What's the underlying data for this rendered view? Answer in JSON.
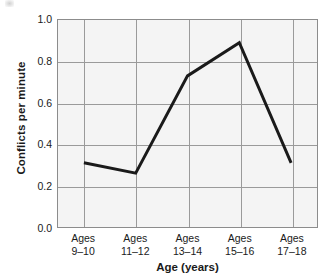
{
  "chart_data": {
    "type": "line",
    "title": "",
    "subtitle": "",
    "xlabel": "Age (years)",
    "ylabel": "Conflicts per minute",
    "categories": [
      "Ages\n9–10",
      "Ages\n11–12",
      "Ages\n13–14",
      "Ages\n15–16",
      "Ages\n17–18"
    ],
    "category_lines": [
      {
        "line1": "Ages",
        "line2": "9–10"
      },
      {
        "line1": "Ages",
        "line2": "11–12"
      },
      {
        "line1": "Ages",
        "line2": "13–14"
      },
      {
        "line1": "Ages",
        "line2": "15–16"
      },
      {
        "line1": "Ages",
        "line2": "17–18"
      }
    ],
    "values": [
      0.31,
      0.26,
      0.73,
      0.89,
      0.31
    ],
    "series": [
      {
        "name": "Conflicts per minute",
        "values": [
          0.31,
          0.26,
          0.73,
          0.89,
          0.31
        ]
      }
    ],
    "ylim": [
      0.0,
      1.0
    ],
    "ytick_values": [
      1.0,
      0.8,
      0.6,
      0.4,
      0.2,
      0.0
    ],
    "ytick_labels": [
      "1.0",
      "0.8",
      "0.6",
      "0.4",
      "0.2",
      "0.0"
    ],
    "grid": true,
    "grid_axes": "both",
    "legend": false,
    "legend_position": "none",
    "markers": false,
    "annotations": []
  },
  "style": {
    "line_color": "#1a1a1a",
    "line_width_px": 3,
    "plot_background": "#f4f4f4",
    "grid_color": "#9a9a9a",
    "axis_border_color": "#8c8c8c",
    "text_color": "#1a1a1a",
    "page_background": "#ffffff"
  }
}
